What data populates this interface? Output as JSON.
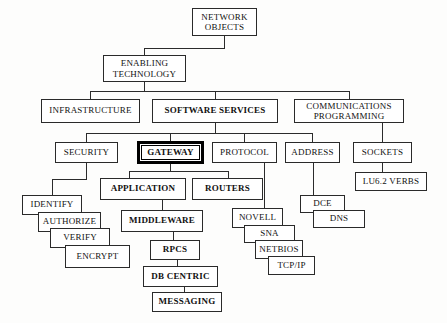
{
  "diagram": {
    "type": "hierarchy-tree",
    "background_color": "#fdfdfc",
    "line_color": "#2b2b2b",
    "nodes": {
      "network_objects": "NETWORK\nOBJECTS",
      "enabling_technology": "ENABLING\nTECHNOLOGY",
      "infrastructure": "INFRASTRUCTURE",
      "software_services": "SOFTWARE SERVICES",
      "communications_programming": "COMMUNICATIONS\nPROGRAMMING",
      "security": "SECURITY",
      "gateway": "GATEWAY",
      "protocol": "PROTOCOL",
      "address": "ADDRESS",
      "sockets": "SOCKETS",
      "lu62_verbs": "LU6.2 VERBS",
      "application": "APPLICATION",
      "routers": "ROUTERS",
      "identify": "IDENTIFY",
      "authorize": "AUTHORIZE",
      "verify": "VERIFY",
      "encrypt": "ENCRYPT",
      "middleware": "MIDDLEWARE",
      "rpcs": "RPCS",
      "db_centric": "DB CENTRIC",
      "messaging": "MESSAGING",
      "novell": "NOVELL",
      "sna": "SNA",
      "netbios": "NETBIOS",
      "tcpip": "TCP/IP",
      "dce": "DCE",
      "dns": "DNS"
    }
  }
}
